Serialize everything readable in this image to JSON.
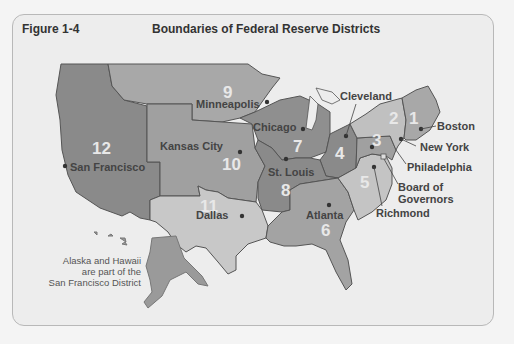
{
  "figure": {
    "label": "Figure 1-4",
    "title": "Boundaries of Federal Reserve Districts"
  },
  "districts": [
    {
      "number": "1",
      "city": "Boston"
    },
    {
      "number": "2",
      "city": "New York"
    },
    {
      "number": "3",
      "city": "Philadelphia"
    },
    {
      "number": "4",
      "city": "Cleveland"
    },
    {
      "number": "5",
      "city": "Richmond"
    },
    {
      "number": "6",
      "city": "Atlanta"
    },
    {
      "number": "7",
      "city": "Chicago"
    },
    {
      "number": "8",
      "city": "St. Louis"
    },
    {
      "number": "9",
      "city": "Minneapolis"
    },
    {
      "number": "10",
      "city": "Kansas City"
    },
    {
      "number": "11",
      "city": "Dallas"
    },
    {
      "number": "12",
      "city": "San Francisco"
    }
  ],
  "board": {
    "line1": "Board of",
    "line2": "Governors"
  },
  "note": {
    "line1": "Alaska and Hawaii",
    "line2": "are part of the",
    "line3": "San Francisco District"
  },
  "colors": {
    "background": "#ededed",
    "district_dark": "#8a8a8a",
    "district_mid": "#a3a3a3",
    "district_light": "#c4c4c4",
    "border": "#555555",
    "label_text": "#444444"
  }
}
